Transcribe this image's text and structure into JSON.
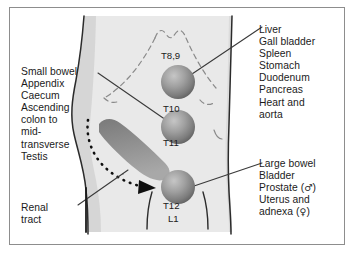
{
  "figure": {
    "type": "anatomical-dermatome-referred-pain-diagram",
    "background_color": "#ffffff",
    "frame_color": "#8d8d8d",
    "body_fill": "#e8e8e8",
    "body_outline": "#2a2a2a",
    "sphere_color_light": "#b9b9b9",
    "sphere_color_dark": "#6d6d6d",
    "colon_band_color": "#8c8c8c",
    "leader_line_color": "#3a3a3a",
    "dotted_arrow_color": "#111111"
  },
  "labels": {
    "upper_right": {
      "name": "foregut-structures",
      "lines": [
        "Liver",
        "Gall bladder",
        "Spleen",
        "Stomach",
        "Duodenum",
        "Pancreas",
        "Heart and",
        "aorta"
      ]
    },
    "lower_right": {
      "name": "hindgut-pelvic-structures",
      "lines_plain": [
        "Large bowel",
        "Bladder",
        "Prostate (",
        "Uterus and",
        "adnexa ("
      ],
      "lines": [
        {
          "text": "Large bowel",
          "symbol": ""
        },
        {
          "text": "Bladder",
          "symbol": ""
        },
        {
          "text": "Prostate (",
          "symbol": "♂",
          "suffix": ")"
        },
        {
          "text": "Uterus and",
          "symbol": ""
        },
        {
          "text": "adnexa (",
          "symbol": "♀",
          "suffix": ")"
        }
      ]
    },
    "left_list": {
      "name": "midgut-structures",
      "lines": [
        "Small bowel",
        "Appendix",
        "Caecum",
        "Ascending",
        "colon to",
        "mid-",
        "transverse",
        "Testis"
      ]
    },
    "renal": {
      "name": "renal-tract",
      "lines": [
        "Renal",
        "tract"
      ]
    }
  },
  "vertebral_levels": [
    {
      "id": "level-t8-9",
      "text": "T8,9",
      "x": 160,
      "y": 52,
      "position": "above-sphere-1"
    },
    {
      "id": "level-t10",
      "text": "T10",
      "x": 162,
      "y": 107,
      "position": "above-sphere-2"
    },
    {
      "id": "level-t11",
      "text": "T11",
      "x": 162,
      "y": 140,
      "position": "below-sphere-2"
    },
    {
      "id": "level-t12",
      "text": "T12",
      "x": 162,
      "y": 204,
      "position": "below-sphere-3"
    },
    {
      "id": "level-l1",
      "text": "L1",
      "x": 166,
      "y": 218,
      "position": "below-sphere-3"
    }
  ],
  "spheres": [
    {
      "id": "pain-site-epigastric",
      "cx": 178,
      "cy": 82,
      "r": 17,
      "level": "T8,9"
    },
    {
      "id": "pain-site-periumbilical",
      "cx": 178,
      "cy": 127,
      "r": 17,
      "level": "T10/T11"
    },
    {
      "id": "pain-site-suprapubic",
      "cx": 178,
      "cy": 187,
      "r": 17,
      "level": "T12/L1"
    }
  ]
}
